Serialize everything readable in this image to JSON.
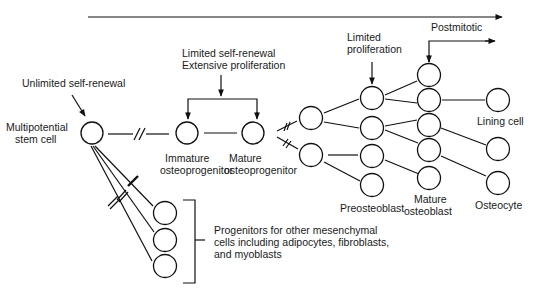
{
  "diagram": {
    "timeline_arrow": "progression-arrow",
    "labels": {
      "unlimited_self_renewal": "Unlimited self-renewal",
      "stem_cell_line1": "Multipotential",
      "stem_cell_line2": "stem cell",
      "limited_self_renewal": "Limited self-renewal",
      "extensive_proliferation": "Extensive proliferation",
      "immature_line1": "Immature",
      "immature_line2": "osteoprogenitor",
      "mature_prog_line1": "Mature",
      "mature_prog_line2": "osteoprogenitor",
      "limited_line1": "Limited",
      "limited_line2": "proliferation",
      "postmitotic": "Postmitotic",
      "preosteoblast": "Preosteoblast",
      "mature_ob_line1": "Mature",
      "mature_ob_line2": "osteoblast",
      "lining_cell": "Lining cell",
      "osteocyte": "Osteocyte",
      "progenitors_line1": "Progenitors for other mesenchymal",
      "progenitors_line2": "cells including adipocytes, fibroblasts,",
      "progenitors_line3": "and myoblasts"
    },
    "colors": {
      "line": "#111111",
      "text": "#1a1a1a",
      "background": "#ffffff"
    }
  }
}
